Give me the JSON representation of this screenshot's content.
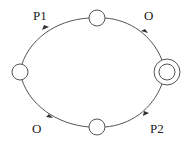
{
  "diagram": {
    "type": "state-machine",
    "nodes": [
      {
        "id": "left",
        "x": 20,
        "y": 72,
        "r": 8,
        "accepting": false
      },
      {
        "id": "top",
        "x": 97,
        "y": 18,
        "r": 8,
        "accepting": false
      },
      {
        "id": "bottom",
        "x": 97,
        "y": 127,
        "r": 8,
        "accepting": false
      },
      {
        "id": "right",
        "x": 167,
        "y": 72,
        "r": 8,
        "outer_r": 13,
        "accepting": true
      }
    ],
    "edges": [
      {
        "from": "left",
        "to": "top",
        "label": "P1"
      },
      {
        "from": "top",
        "to": "right",
        "label": "O"
      },
      {
        "from": "left",
        "to": "bottom",
        "label": "O"
      },
      {
        "from": "bottom",
        "to": "right",
        "label": "P2"
      }
    ],
    "labels": {
      "top_left": "P1",
      "top_right": "O",
      "bottom_left": "O",
      "bottom_right": "P2"
    },
    "colors": {
      "stroke": "#555555",
      "text": "#222222",
      "background": "#ffffff"
    }
  }
}
